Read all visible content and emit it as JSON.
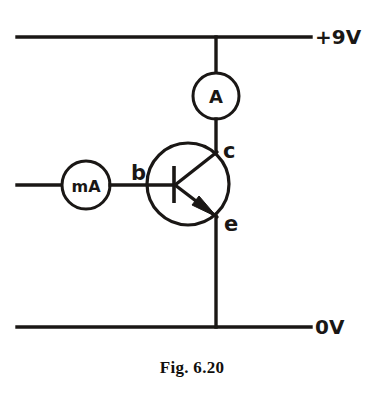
{
  "figure": {
    "caption": "Fig. 6.20",
    "type": "hand-drawn circuit diagram"
  },
  "rails": {
    "supply": {
      "label": "+9V",
      "y": 37,
      "x_start": 17,
      "x_end": 311
    },
    "ground": {
      "label": "0V",
      "y": 327,
      "x_start": 17,
      "x_end": 311
    }
  },
  "meters": [
    {
      "id": "ammeter",
      "label": "A",
      "name": "ammeter",
      "cx": 216,
      "cy": 96,
      "r": 23,
      "branch": "collector"
    },
    {
      "id": "milliammeter",
      "label": "mA",
      "name": "milliammeter",
      "cx": 86,
      "cy": 185,
      "r": 24,
      "branch": "base"
    }
  ],
  "transistor": {
    "type": "npn",
    "cx": 188,
    "cy": 184,
    "r": 41,
    "terminals": [
      {
        "id": "base",
        "label": "b",
        "x": 133,
        "y": 184
      },
      {
        "id": "collector",
        "label": "c",
        "x": 222,
        "y": 150
      },
      {
        "id": "emitter",
        "label": "e",
        "x": 222,
        "y": 218
      }
    ]
  },
  "wires": {
    "collector_vertical_x": 216,
    "base_horizontal_y": 185,
    "base_wire_x_start": 17
  },
  "colors": {
    "ink": "#1a1715",
    "paper": "#ffffff",
    "caption": "#110f0d"
  }
}
